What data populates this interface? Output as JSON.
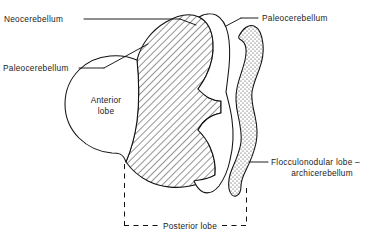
{
  "figure": {
    "background_color": "#ffffff",
    "line_color": "#111111",
    "width": 377,
    "height": 243
  },
  "labels": {
    "neocerebellum": "Neocerebellum",
    "paleocerebellum_left": "Paleocerebellum",
    "paleocerebellum_right": "Paleocerebellum",
    "anterior_lobe_line1": "Anterior",
    "anterior_lobe_line2": "lobe",
    "flocculonodular_line1": "Flocculonodular lobe –",
    "flocculonodular_line2": "archicerebellum",
    "posterior_lobe": "Posterior lobe"
  },
  "regions": {
    "hatched": {
      "name": "neocerebellum-hatched-region",
      "pattern": "diagonal-hatch",
      "angle_deg": 45
    },
    "stippled": {
      "name": "flocculonodular-stippled-region",
      "pattern": "stipple-dots"
    },
    "white_anterior": {
      "name": "anterior-lobe-white-region",
      "pattern": "none"
    },
    "white_paleocerebellum": {
      "name": "paleocerebellum-white-strip",
      "pattern": "none"
    }
  },
  "bracket": {
    "name": "posterior-lobe-bracket",
    "style": "dashed",
    "left_x": 124,
    "right_x": 246,
    "bottom_y": 226
  }
}
